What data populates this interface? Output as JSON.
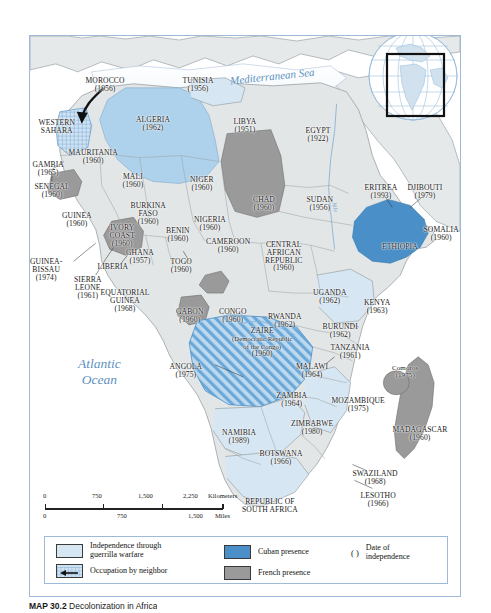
{
  "figure": {
    "caption_label": "MAP 30.2",
    "caption_title": "Decolonization in Africa",
    "copyright": "© Cengage Learning 2012"
  },
  "map": {
    "oceans": [
      {
        "name": "Mediterranean Sea",
        "x": 233,
        "y": 43,
        "size": 11
      },
      {
        "name": "Atlantic\nOcean",
        "x": 80,
        "y": 330,
        "size": 13
      }
    ],
    "rivers": [
      {
        "name": "Nile",
        "x": 304,
        "y": 175,
        "rot": 78
      },
      {
        "name": "Congo",
        "x": 226,
        "y": 283,
        "rot": -8
      }
    ],
    "countries": [
      {
        "name": "MOROCCO",
        "year": "(1956)",
        "x": 75,
        "y": 41,
        "cls": "cty"
      },
      {
        "name": "TUNISIA",
        "year": "(1956)",
        "x": 168,
        "y": 41,
        "cls": "cty"
      },
      {
        "name": "ALGERIA",
        "year": "(1962)",
        "x": 123,
        "y": 80,
        "cls": "cty"
      },
      {
        "name": "LIBYA",
        "year": "(1951)",
        "x": 215,
        "y": 82,
        "cls": "cty"
      },
      {
        "name": "EGYPT",
        "year": "(1922)",
        "x": 288,
        "y": 91,
        "cls": "cty"
      },
      {
        "name": "WESTERN\nSAHARA",
        "year": "",
        "x": 27,
        "y": 83,
        "cls": "cty"
      },
      {
        "name": "MAURITANIA",
        "year": "(1960)",
        "x": 63,
        "y": 113,
        "cls": "cty inlineyear"
      },
      {
        "name": "GAMBIA",
        "year": "(1965)",
        "x": 18,
        "y": 125,
        "cls": "cty"
      },
      {
        "name": "SENEGAL",
        "year": "(1960)",
        "x": 22,
        "y": 147,
        "cls": "cty"
      },
      {
        "name": "MALI",
        "year": "(1960)",
        "x": 103,
        "y": 137,
        "cls": "cty"
      },
      {
        "name": "NIGER",
        "year": "(1960)",
        "x": 172,
        "y": 140,
        "cls": "cty"
      },
      {
        "name": "CHAD",
        "year": "(1960)",
        "x": 234,
        "y": 160,
        "cls": "cty"
      },
      {
        "name": "SUDAN",
        "year": "(1956)",
        "x": 290,
        "y": 160,
        "cls": "cty"
      },
      {
        "name": "ERITREA",
        "year": "(1993)",
        "x": 351,
        "y": 148,
        "cls": "cty"
      },
      {
        "name": "DJIBOUTI",
        "year": "(1979)",
        "x": 395,
        "y": 148,
        "cls": "cty"
      },
      {
        "name": "ETHIOPIA",
        "year": "",
        "x": 370,
        "y": 207,
        "cls": "cty"
      },
      {
        "name": "SOMALIA",
        "year": "(1960)",
        "x": 411,
        "y": 190,
        "cls": "cty"
      },
      {
        "name": "BURKINA\nFASO",
        "year": "(1960)",
        "x": 118,
        "y": 166,
        "cls": "cty"
      },
      {
        "name": "GUINEA",
        "year": "(1960)",
        "x": 47,
        "y": 176,
        "cls": "cty"
      },
      {
        "name": "IVORY\nCOAST",
        "year": "(1960)",
        "x": 92,
        "y": 188,
        "cls": "cty"
      },
      {
        "name": "NIGERIA",
        "year": "(1960)",
        "x": 180,
        "y": 180,
        "cls": "cty"
      },
      {
        "name": "BENIN",
        "year": "(1960)",
        "x": 148,
        "y": 191,
        "cls": "cty"
      },
      {
        "name": "GHANA",
        "year": "(1957)",
        "x": 110,
        "y": 213,
        "cls": "cty"
      },
      {
        "name": "TOGO",
        "year": "(1960)",
        "x": 151,
        "y": 222,
        "cls": "cty"
      },
      {
        "name": "CAMEROON",
        "year": "(1960)",
        "x": 198,
        "y": 202,
        "cls": "cty"
      },
      {
        "name": "LIBERIA",
        "year": "",
        "x": 83,
        "y": 227,
        "cls": "cty"
      },
      {
        "name": "GUINEA-\nBISSAU",
        "year": "(1974)",
        "x": 16,
        "y": 222,
        "cls": "cty"
      },
      {
        "name": "SIERRA\nLEONE",
        "year": "(1961)",
        "x": 58,
        "y": 240,
        "cls": "cty"
      },
      {
        "name": "EQUATORIAL\nGUINEA",
        "year": "(1968)",
        "x": 95,
        "y": 253,
        "cls": "cty"
      },
      {
        "name": "CENTRAL\nAFRICAN\nREPUBLIC",
        "year": "(1960)",
        "x": 254,
        "y": 205,
        "cls": "cty"
      },
      {
        "name": "UGANDA",
        "year": "(1962)",
        "x": 300,
        "y": 253,
        "cls": "cty"
      },
      {
        "name": "KENYA",
        "year": "(1963)",
        "x": 347,
        "y": 263,
        "cls": "cty"
      },
      {
        "name": "GABON",
        "year": "(1960)",
        "x": 160,
        "y": 272,
        "cls": "cty"
      },
      {
        "name": "CONGO",
        "year": "(1960)",
        "x": 203,
        "y": 272,
        "cls": "cty"
      },
      {
        "name": "RWANDA",
        "year": "(1962)",
        "x": 255,
        "y": 277,
        "cls": "cty"
      },
      {
        "name": "BURUNDI",
        "year": "(1962)",
        "x": 310,
        "y": 287,
        "cls": "cty"
      },
      {
        "name": "ZAIRE",
        "year": "(1960)",
        "x": 232,
        "y": 291,
        "cls": "cty",
        "sub": "(Democratic Republic\nof the Congo)"
      },
      {
        "name": "TANZANIA",
        "year": "(1961)",
        "x": 320,
        "y": 308,
        "cls": "cty"
      },
      {
        "name": "ANGOLA",
        "year": "(1975)",
        "x": 156,
        "y": 327,
        "cls": "cty"
      },
      {
        "name": "MALAWI",
        "year": "(1964)",
        "x": 282,
        "y": 327,
        "cls": "cty"
      },
      {
        "name": "ZAMBIA",
        "year": "(1964)",
        "x": 262,
        "y": 356,
        "cls": "cty"
      },
      {
        "name": "MOZAMBIQUE",
        "year": "(1975)",
        "x": 328,
        "y": 361,
        "cls": "cty"
      },
      {
        "name": "Comoros",
        "year": "(1975)",
        "x": 375,
        "y": 329,
        "cls": "cty small"
      },
      {
        "name": "ZIMBABWE",
        "year": "(1980)",
        "x": 282,
        "y": 384,
        "cls": "cty"
      },
      {
        "name": "NAMIBIA",
        "year": "(1989)",
        "x": 209,
        "y": 393,
        "cls": "cty"
      },
      {
        "name": "BOTSWANA",
        "year": "(1966)",
        "x": 251,
        "y": 414,
        "cls": "cty"
      },
      {
        "name": "MADAGASCAR",
        "year": "(1960)",
        "x": 390,
        "y": 390,
        "cls": "cty"
      },
      {
        "name": "SWAZILAND",
        "year": "(1968)",
        "x": 345,
        "y": 434,
        "cls": "cty"
      },
      {
        "name": "LESOTHO",
        "year": "(1966)",
        "x": 348,
        "y": 456,
        "cls": "cty"
      },
      {
        "name": "REPUBLIC OF\nSOUTH AFRICA",
        "year": "",
        "x": 240,
        "y": 462,
        "cls": "cty"
      }
    ]
  },
  "scale": {
    "km_ticks": [
      "0",
      "750",
      "1,500",
      "2,250"
    ],
    "km_unit": "Kilometers",
    "mi_ticks": [
      "0",
      "750",
      "1,500"
    ],
    "mi_unit": "Miles"
  },
  "legend": {
    "items": [
      {
        "key": "guerrilla",
        "label": "Independence through\nguerrilla warfare"
      },
      {
        "key": "occupation",
        "label": "Occupation by neighbor"
      },
      {
        "key": "cuban",
        "label": "Cuban presence"
      },
      {
        "key": "french",
        "label": "French presence"
      },
      {
        "key": "date",
        "symbol": "(  )",
        "label": "Date of\nindependence"
      }
    ]
  },
  "colors": {
    "guerrilla": "#d6e6f3",
    "cuban": "#4a8fc7",
    "french": "#9a9a9a",
    "land_default": "#e3e6e7",
    "water": "#ffffff",
    "frame": "#9fb9d8",
    "ocean_text": "#5d8fc0"
  }
}
